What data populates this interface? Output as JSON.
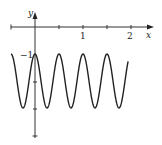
{
  "chart_data": {
    "type": "line",
    "title": "",
    "function": "y = cos(4πx) - 2",
    "xlabel": "x",
    "ylabel": "y",
    "xlim": [
      -0.5,
      2.5
    ],
    "ylim": [
      -4,
      0.3
    ],
    "x_tick_labels": [
      "1",
      "2"
    ],
    "x_ticks": [
      -0.5,
      0,
      0.5,
      1,
      1.5,
      2
    ],
    "y_tick_labels": [
      "-1"
    ],
    "y_ticks": [
      -1,
      -2,
      -3,
      -4
    ],
    "series": [
      {
        "name": "curve",
        "x": [
          -0.5,
          -0.375,
          -0.25,
          -0.125,
          0,
          0.125,
          0.25,
          0.375,
          0.5,
          0.625,
          0.75,
          0.875,
          1,
          1.125,
          1.25,
          1.375,
          1.5,
          1.625,
          1.75,
          1.875,
          2,
          2.125,
          2.25,
          2.375,
          2.5
        ],
        "values": [
          -1,
          -2,
          -3,
          -2,
          -1,
          -2,
          -3,
          -2,
          -1,
          -2,
          -3,
          -2,
          -1,
          -2,
          -3,
          -2,
          -1,
          -2,
          -3,
          -2,
          -1,
          -2,
          -3,
          -2,
          -1
        ]
      }
    ],
    "grid": false,
    "legend": "none",
    "color": "#222222"
  },
  "labels": {
    "x_axis": "x",
    "y_axis": "y",
    "tick_1": "1",
    "tick_2": "2",
    "tick_neg1": "−1"
  }
}
